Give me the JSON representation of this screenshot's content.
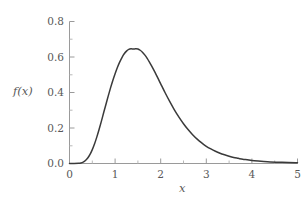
{
  "chart_data": {
    "type": "line",
    "title": "",
    "subtitle": "",
    "xlabel": "x",
    "ylabel": "f(x)",
    "xlim": [
      0,
      5
    ],
    "ylim": [
      0.0,
      0.8
    ],
    "grid": false,
    "legend": null,
    "legend_position": "none",
    "annotations": [],
    "xticks": [
      0,
      1,
      2,
      3,
      4,
      5
    ],
    "xtick_labels": [
      "0",
      "1",
      "2",
      "3",
      "4",
      "5"
    ],
    "yticks": [
      0.0,
      0.2,
      0.4,
      0.6,
      0.8
    ],
    "ytick_labels": [
      "0.0",
      "0.2",
      "0.4",
      "0.6",
      "0.8"
    ],
    "series": [
      {
        "name": "f(x)",
        "color": "#3a3a3a",
        "linewidth": 1.5,
        "peak_x": 1.5,
        "peak_y": 0.645,
        "x": [
          0.0,
          0.1,
          0.2,
          0.25,
          0.3,
          0.35,
          0.4,
          0.45,
          0.5,
          0.55,
          0.6,
          0.65,
          0.7,
          0.75,
          0.8,
          0.85,
          0.9,
          0.95,
          1.0,
          1.05,
          1.1,
          1.15,
          1.2,
          1.25,
          1.3,
          1.35,
          1.4,
          1.45,
          1.5,
          1.55,
          1.6,
          1.65,
          1.7,
          1.75,
          1.8,
          1.85,
          1.9,
          1.95,
          2.0,
          2.1,
          2.2,
          2.3,
          2.4,
          2.5,
          2.6,
          2.7,
          2.8,
          2.9,
          3.0,
          3.1,
          3.2,
          3.3,
          3.4,
          3.5,
          3.6,
          3.7,
          3.8,
          3.9,
          4.0,
          4.2,
          4.4,
          4.6,
          4.8,
          5.0
        ],
        "y": [
          0.0,
          0.0,
          0.001,
          0.003,
          0.008,
          0.017,
          0.031,
          0.051,
          0.078,
          0.111,
          0.15,
          0.193,
          0.239,
          0.287,
          0.334,
          0.381,
          0.426,
          0.468,
          0.506,
          0.541,
          0.571,
          0.597,
          0.618,
          0.633,
          0.643,
          0.646,
          0.645,
          0.646,
          0.645,
          0.638,
          0.627,
          0.612,
          0.594,
          0.573,
          0.55,
          0.526,
          0.501,
          0.475,
          0.449,
          0.397,
          0.348,
          0.302,
          0.261,
          0.224,
          0.191,
          0.162,
          0.137,
          0.116,
          0.097,
          0.082,
          0.069,
          0.058,
          0.049,
          0.041,
          0.034,
          0.029,
          0.024,
          0.021,
          0.017,
          0.013,
          0.009,
          0.007,
          0.005,
          0.004
        ]
      }
    ]
  },
  "axes": {
    "x_title": "x",
    "y_title": "f(x)",
    "spine_color": "#9a9a9a",
    "tick_color": "#9a9a9a",
    "label_color": "#585858",
    "background": "#ffffff"
  }
}
